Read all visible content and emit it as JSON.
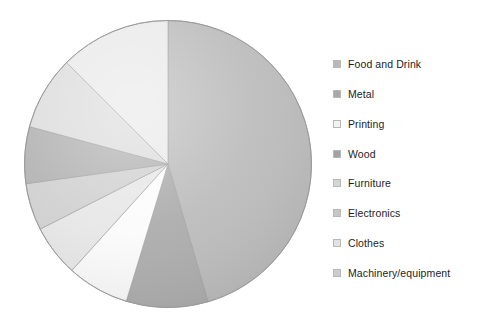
{
  "chart_data": {
    "type": "pie",
    "title": "",
    "subtitle": "",
    "xlabel": "",
    "ylabel": "",
    "grid": false,
    "legend_position": "right",
    "start_angle_deg": 0,
    "direction": "clockwise",
    "categories": [
      "Food and Drink",
      "Metal",
      "Printing",
      "Wood",
      "Furniture",
      "Electronics",
      "Clothes",
      "Machinery/equipment"
    ],
    "values": [
      45.5,
      9.2,
      7.0,
      5.8,
      5.3,
      6.4,
      8.3,
      12.5
    ],
    "units": "percent",
    "slice_colors": [
      "#b9b9b9",
      "#a8a8a8",
      "#fbfbfb",
      "#e6e6e6",
      "#cfcfcf",
      "#b0b0b0",
      "#dcdcdc",
      "#e9e9e9"
    ],
    "slices": [
      {
        "label": "Food and Drink",
        "value": 45.5,
        "start_deg": 0.0,
        "end_deg": 163.8,
        "color": "#b9b9b9"
      },
      {
        "label": "Metal",
        "value": 9.2,
        "start_deg": 163.8,
        "end_deg": 196.9,
        "color": "#a8a8a8"
      },
      {
        "label": "Printing",
        "value": 7.0,
        "start_deg": 196.9,
        "end_deg": 222.1,
        "color": "#fbfbfb"
      },
      {
        "label": "Wood",
        "value": 5.8,
        "start_deg": 222.1,
        "end_deg": 243.0,
        "color": "#e6e6e6"
      },
      {
        "label": "Furniture",
        "value": 5.3,
        "start_deg": 243.0,
        "end_deg": 262.1,
        "color": "#cfcfcf"
      },
      {
        "label": "Electronics",
        "value": 6.4,
        "start_deg": 262.1,
        "end_deg": 285.1,
        "color": "#b0b0b0"
      },
      {
        "label": "Clothes",
        "value": 8.3,
        "start_deg": 285.1,
        "end_deg": 315.0,
        "color": "#dcdcdc"
      },
      {
        "label": "Machinery/equipment",
        "value": 12.5,
        "start_deg": 315.0,
        "end_deg": 360.0,
        "color": "#e9e9e9"
      }
    ]
  },
  "legend": {
    "items": [
      {
        "label": "Food and Drink",
        "swatch": "#b9b9b9"
      },
      {
        "label": "Metal",
        "swatch": "#a8a8a8"
      },
      {
        "label": "Printing",
        "swatch": "#f2f2f2"
      },
      {
        "label": "Wood",
        "swatch": "#a2a2a2"
      },
      {
        "label": "Furniture",
        "swatch": "#d6d6d6"
      },
      {
        "label": "Electronics",
        "swatch": "#c6c6c6"
      },
      {
        "label": "Clothes",
        "swatch": "#e2e2e2"
      },
      {
        "label": "Machinery/equipment",
        "swatch": "#cccccc"
      }
    ]
  }
}
